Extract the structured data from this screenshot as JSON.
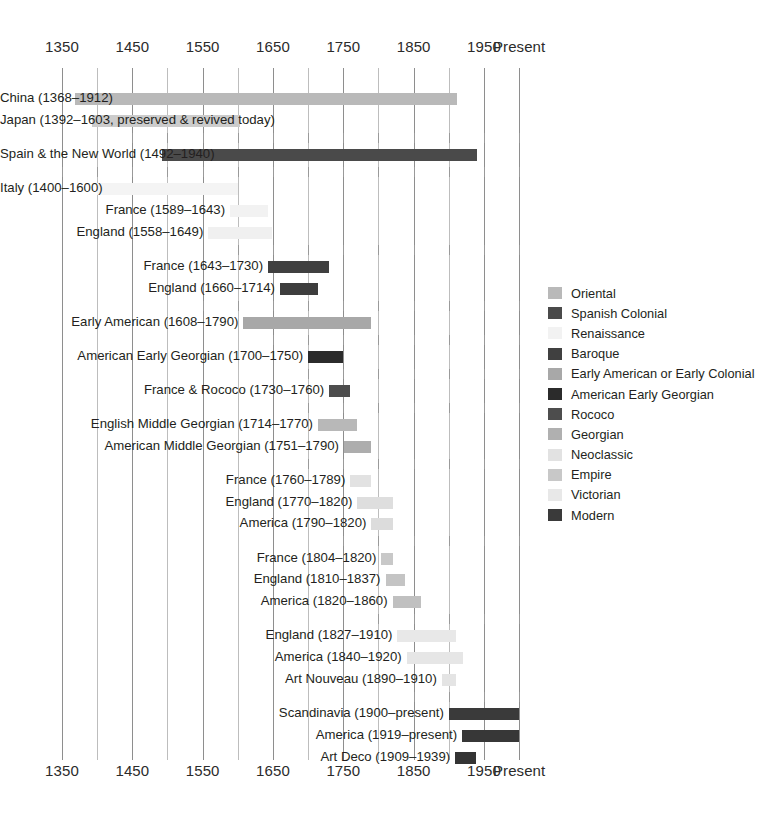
{
  "chart_data": {
    "type": "bar",
    "title": "",
    "xlabel": "",
    "ylabel": "",
    "orientation": "horizontal-timeline",
    "xlim": [
      1350,
      2000
    ],
    "grid": true,
    "legend_position": "right",
    "axis": {
      "ticks": [
        {
          "label": "1350",
          "year": 1350
        },
        {
          "label": "1450",
          "year": 1450
        },
        {
          "label": "1550",
          "year": 1550
        },
        {
          "label": "1650",
          "year": 1650
        },
        {
          "label": "1750",
          "year": 1750
        },
        {
          "label": "1850",
          "year": 1850
        },
        {
          "label": "1950",
          "year": 1950
        },
        {
          "label": "Present",
          "year": 2000
        }
      ],
      "minor_interval": 50
    },
    "legend": [
      {
        "label": "Oriental",
        "color": "#b9b9b9"
      },
      {
        "label": "Spanish Colonial",
        "color": "#4a4a4a"
      },
      {
        "label": "Renaissance",
        "color": "#f2f2f2"
      },
      {
        "label": "Baroque",
        "color": "#404040"
      },
      {
        "label": "Early American or Early Colonial",
        "color": "#a8a8a8"
      },
      {
        "label": "American Early Georgian",
        "color": "#2b2b2b"
      },
      {
        "label": "Rococo",
        "color": "#4d4d4d"
      },
      {
        "label": "Georgian",
        "color": "#b0b0b0"
      },
      {
        "label": "Neoclassic",
        "color": "#e2e2e2"
      },
      {
        "label": "Empire",
        "color": "#c8c8c8"
      },
      {
        "label": "Victorian",
        "color": "#e8e8e8"
      },
      {
        "label": "Modern",
        "color": "#3a3a3a"
      }
    ],
    "groups": [
      {
        "name": "Oriental",
        "bars": [
          {
            "label": "China (1368–1912)",
            "start": 1368,
            "end": 1912,
            "color": "#b9b9b9"
          },
          {
            "label": "Japan (1392–1603, preserved & revived today)",
            "start": 1392,
            "end": 1603,
            "color": "#cccccc"
          }
        ]
      },
      {
        "name": "Spanish Colonial",
        "bars": [
          {
            "label": "Spain & the New World (1492–1940)",
            "start": 1492,
            "end": 1940,
            "color": "#4a4a4a"
          }
        ]
      },
      {
        "name": "Renaissance",
        "bars": [
          {
            "label": "Italy (1400–1600)",
            "start": 1400,
            "end": 1600,
            "color": "#f4f4f4"
          },
          {
            "label": "France (1589–1643)",
            "start": 1589,
            "end": 1643,
            "color": "#f2f2f2"
          },
          {
            "label": "England (1558–1649)",
            "start": 1558,
            "end": 1649,
            "color": "#f0f0f0"
          }
        ]
      },
      {
        "name": "Baroque",
        "bars": [
          {
            "label": "France (1643–1730)",
            "start": 1643,
            "end": 1730,
            "color": "#404040"
          },
          {
            "label": "England (1660–1714)",
            "start": 1660,
            "end": 1714,
            "color": "#3d3d3d"
          }
        ]
      },
      {
        "name": "Early American or Early Colonial",
        "bars": [
          {
            "label": "Early American (1608–1790)",
            "start": 1608,
            "end": 1790,
            "color": "#a8a8a8"
          }
        ]
      },
      {
        "name": "American Early Georgian",
        "bars": [
          {
            "label": "American Early Georgian (1700–1750)",
            "start": 1700,
            "end": 1750,
            "color": "#2b2b2b"
          }
        ]
      },
      {
        "name": "Rococo",
        "bars": [
          {
            "label": "France & Rococo (1730–1760)",
            "start": 1730,
            "end": 1760,
            "color": "#4d4d4d"
          }
        ]
      },
      {
        "name": "Georgian",
        "bars": [
          {
            "label": "English Middle Georgian (1714–1770)",
            "start": 1714,
            "end": 1770,
            "color": "#b8b8b8"
          },
          {
            "label": "American Middle Georgian (1751–1790)",
            "start": 1751,
            "end": 1790,
            "color": "#adadad"
          }
        ]
      },
      {
        "name": "Neoclassic",
        "bars": [
          {
            "label": "France (1760–1789)",
            "start": 1760,
            "end": 1789,
            "color": "#e2e2e2"
          },
          {
            "label": "England (1770–1820)",
            "start": 1770,
            "end": 1820,
            "color": "#dedede"
          },
          {
            "label": "America (1790–1820)",
            "start": 1790,
            "end": 1820,
            "color": "#dcdcdc"
          }
        ]
      },
      {
        "name": "Empire",
        "bars": [
          {
            "label": "France (1804–1820)",
            "start": 1804,
            "end": 1820,
            "color": "#c8c8c8"
          },
          {
            "label": "England (1810–1837)",
            "start": 1810,
            "end": 1837,
            "color": "#c4c4c4"
          },
          {
            "label": "America (1820–1860)",
            "start": 1820,
            "end": 1860,
            "color": "#c0c0c0"
          }
        ]
      },
      {
        "name": "Victorian",
        "bars": [
          {
            "label": "England (1827–1910)",
            "start": 1827,
            "end": 1910,
            "color": "#e8e8e8"
          },
          {
            "label": "America (1840–1920)",
            "start": 1840,
            "end": 1920,
            "color": "#e6e6e6"
          },
          {
            "label": "Art Nouveau (1890–1910)",
            "start": 1890,
            "end": 1910,
            "color": "#e4e4e4"
          }
        ]
      },
      {
        "name": "Modern",
        "bars": [
          {
            "label": "Scandinavia (1900–present)",
            "start": 1900,
            "end": 2000,
            "color": "#3a3a3a"
          },
          {
            "label": "America (1919–present)",
            "start": 1919,
            "end": 2000,
            "color": "#373737"
          },
          {
            "label": "Art Deco (1909–1939)",
            "start": 1909,
            "end": 1939,
            "color": "#343434"
          }
        ]
      }
    ]
  }
}
